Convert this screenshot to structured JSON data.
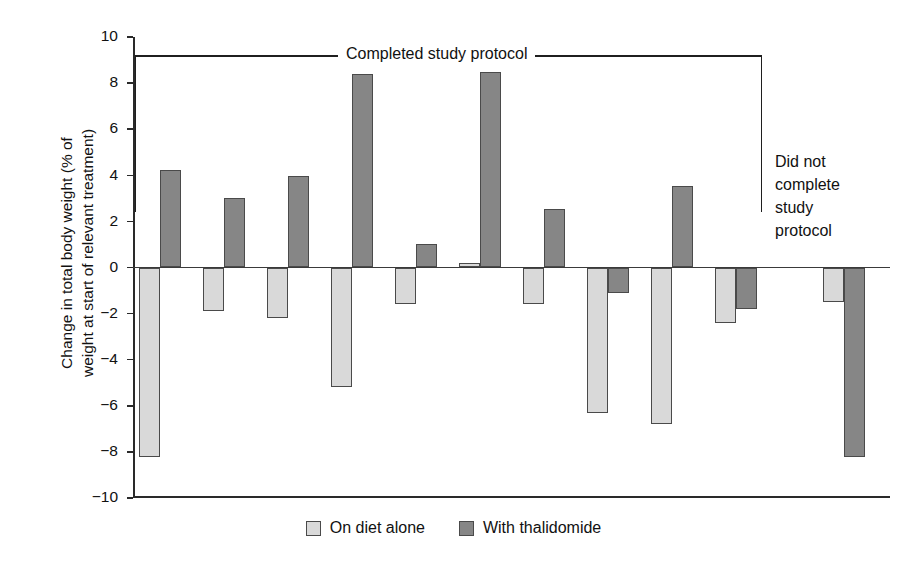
{
  "chart_data": {
    "type": "bar",
    "title": "",
    "xlabel": "",
    "ylabel": "Change in total body weight (% of\nweight at start of relevant treatment)",
    "ylim": [
      -10,
      10
    ],
    "ytick_labels": [
      "10",
      "8",
      "6",
      "4",
      "2",
      "0",
      "−2",
      "−4",
      "−6",
      "−8",
      "−10"
    ],
    "ytick_values": [
      10,
      8,
      6,
      4,
      2,
      0,
      -2,
      -4,
      -6,
      -8,
      -10
    ],
    "grid": false,
    "legend_position": "bottom-center",
    "categories": [
      "1",
      "2",
      "3",
      "4",
      "5",
      "6",
      "7",
      "8",
      "9",
      "10",
      "11"
    ],
    "series": [
      {
        "name": "On diet alone",
        "color": "#d9d9d9",
        "values": [
          -8.2,
          -1.9,
          -2.2,
          -5.2,
          -1.6,
          0.2,
          -1.6,
          -6.3,
          -6.8,
          -2.4,
          -1.5
        ]
      },
      {
        "name": "With thalidomide",
        "color": "#868686",
        "values": [
          4.25,
          3.0,
          3.95,
          8.4,
          1.0,
          8.5,
          2.55,
          -1.1,
          3.55,
          -1.8,
          -8.2
        ]
      }
    ],
    "annotations": [
      {
        "name": "completed-bracket",
        "text": "Completed study protocol",
        "covers": [
          "1",
          "10"
        ]
      },
      {
        "name": "did-not-complete-note",
        "text": "Did not\ncomplete\nstudy\nprotocol",
        "covers": [
          "11"
        ]
      }
    ]
  },
  "legend": {
    "items": [
      {
        "label": "On diet alone",
        "swatch": "light-swatch"
      },
      {
        "label": "With thalidomide",
        "swatch": "dark-swatch"
      }
    ]
  }
}
